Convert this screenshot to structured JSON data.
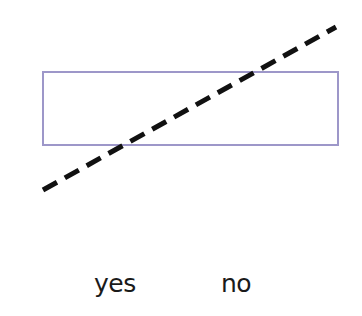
{
  "diagram": {
    "box": {
      "x": 43,
      "y": 72,
      "width": 295,
      "height": 73,
      "stroke": "#9d97c9"
    },
    "dashed_line": {
      "x1": 43,
      "y1": 190,
      "x2": 336,
      "y2": 27,
      "stroke": "#111111",
      "dash": "16 9",
      "width": 5
    },
    "labels": [
      {
        "text": "yes",
        "x": 94,
        "y": 271
      },
      {
        "text": "no",
        "x": 221,
        "y": 271
      }
    ]
  }
}
